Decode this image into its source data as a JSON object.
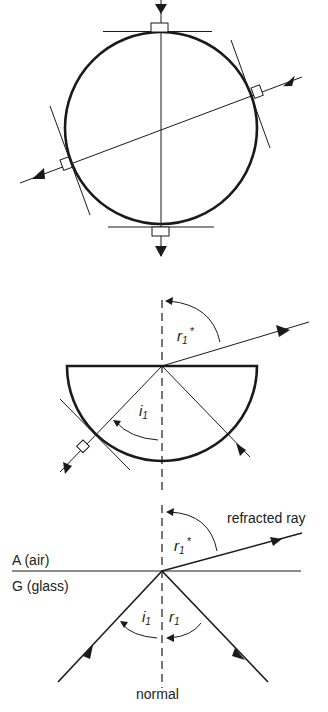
{
  "figure": {
    "panels": [
      {
        "id": "circle-block",
        "description": "Circular glass block with ray passing through centre along normals"
      },
      {
        "id": "semicircle-block",
        "description": "Semicircular glass block, ray entering curved side along radius, partially reflected and refracted at flat face",
        "labels": {
          "refraction_angle": "r",
          "refraction_sub": "1",
          "refraction_star": "*",
          "incidence_angle": "i",
          "incidence_sub": "1"
        }
      },
      {
        "id": "interface",
        "description": "Ray at glass-air interface with incident, reflected and refracted rays",
        "labels": {
          "refracted_ray": "refracted ray",
          "air": "A (air)",
          "glass": "G (glass)",
          "normal": "normal",
          "refraction_angle": "r",
          "refraction_sub": "1",
          "refraction_star": "*",
          "incidence_angle": "i",
          "incidence_sub": "1",
          "reflection_angle": "r",
          "reflection_sub": "1"
        }
      }
    ]
  },
  "colors": {
    "ink": "#1a1a1a",
    "background": "#ffffff"
  }
}
